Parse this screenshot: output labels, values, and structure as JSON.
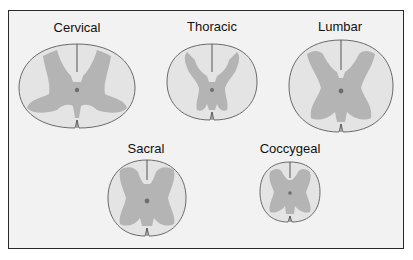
{
  "diagram": {
    "colors": {
      "white_matter": "#e4e4e4",
      "gray_matter": "#b4b4b4",
      "outline": "#6a6a6a",
      "central_canal": "#6e6e6e",
      "frame_border": "#2a2a2a",
      "frame_background": "#f2f2f2"
    },
    "sections": [
      {
        "id": "cervical",
        "label": "Cervical"
      },
      {
        "id": "thoracic",
        "label": "Thoracic"
      },
      {
        "id": "lumbar",
        "label": "Lumbar"
      },
      {
        "id": "sacral",
        "label": "Sacral"
      },
      {
        "id": "coccygeal",
        "label": "Coccygeal"
      }
    ]
  }
}
